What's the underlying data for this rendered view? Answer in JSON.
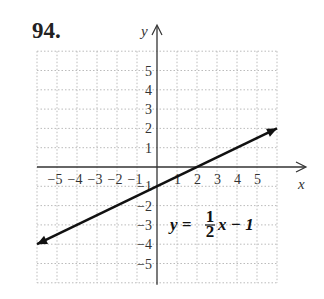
{
  "problem": {
    "number": "94."
  },
  "chart_data": {
    "type": "line",
    "title": "",
    "xlabel": "x",
    "ylabel": "y",
    "xlim": [
      -6,
      6
    ],
    "ylim": [
      -6,
      6
    ],
    "grid": true,
    "x_ticks": [
      -5,
      -4,
      -3,
      -2,
      -1,
      1,
      2,
      3,
      4,
      5
    ],
    "y_ticks": [
      5,
      4,
      3,
      2,
      1,
      -1,
      -2,
      -3,
      -4,
      -5
    ],
    "x_tick_labels": [
      "−5",
      "−4",
      "−3",
      "−2",
      "−1",
      "1",
      "2",
      "3",
      "4",
      "5"
    ],
    "y_tick_labels": [
      "5",
      "4",
      "3",
      "2",
      "1",
      "−1",
      "−2",
      "−3",
      "−4",
      "−5"
    ],
    "series": [
      {
        "name": "y = (1/2)x − 1",
        "x": [
          -6,
          6
        ],
        "y": [
          -4,
          2
        ],
        "arrows_both_ends": true
      }
    ],
    "annotations": [
      {
        "text_lhs": "y =",
        "fraction_num": "1",
        "fraction_den": "2",
        "text_rhs": "x − 1",
        "x": 0.5,
        "y": -3
      }
    ]
  }
}
